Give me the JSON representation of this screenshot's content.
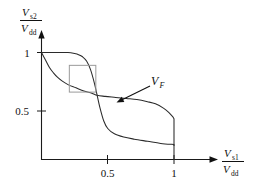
{
  "figure": {
    "kind": "butterfly-curve",
    "background_color": "#ffffff",
    "curve_color": "#2b2b2b",
    "axis_color": "#1a1a1a",
    "inset_box_color": "#9a9a9a"
  },
  "axes": {
    "y": {
      "numerator": "V",
      "numerator_sub": "s2",
      "denominator": "V",
      "denominator_sub": "dd",
      "ticks": [
        {
          "label": "1",
          "value": 1
        },
        {
          "label": "0.5",
          "value": 0.5
        }
      ]
    },
    "x": {
      "numerator": "V",
      "numerator_sub": "s1",
      "denominator": "V",
      "denominator_sub": "dd",
      "ticks": [
        {
          "label": "0.5",
          "value": 0.5
        },
        {
          "label": "1",
          "value": 1
        }
      ]
    }
  },
  "annotations": {
    "crossing_point": {
      "label_main": "V",
      "label_sub": "F",
      "x": 0.42,
      "y": 0.6
    }
  },
  "chart_data": {
    "type": "line",
    "title": "",
    "xlabel": "V_s1 / V_dd",
    "ylabel": "V_s2 / V_dd",
    "xlim": [
      0,
      1.12
    ],
    "ylim": [
      0,
      1.12
    ],
    "grid": false,
    "legend": "none",
    "xticks": [
      0.5,
      1
    ],
    "yticks": [
      0.5,
      1
    ],
    "annotations": [
      {
        "text": "V_F",
        "x": 0.42,
        "y": 0.6,
        "kind": "arrow-label"
      }
    ],
    "inset_box": {
      "x0": 0.21,
      "y0": 0.63,
      "x1": 0.41,
      "y1": 0.88
    },
    "series": [
      {
        "name": "inverter-1-vtc",
        "comment": "upper/flat branch: starts at (0,1), stays near 1, falls steeply near x=0.42, tails low, drops vertically at x=1",
        "x": [
          0.0,
          0.05,
          0.1,
          0.15,
          0.2,
          0.25,
          0.28,
          0.31,
          0.34,
          0.37,
          0.4,
          0.42,
          0.44,
          0.47,
          0.5,
          0.55,
          0.62,
          0.7,
          0.8,
          0.9,
          1.0,
          1.0
        ],
        "y": [
          1.0,
          1.0,
          1.0,
          1.0,
          1.0,
          0.99,
          0.98,
          0.96,
          0.92,
          0.84,
          0.71,
          0.6,
          0.49,
          0.36,
          0.29,
          0.24,
          0.21,
          0.19,
          0.17,
          0.15,
          0.14,
          0.0
        ]
      },
      {
        "name": "inverter-2-vtc-mirrored",
        "comment": "lower/steep-first branch: starts at (0,1), falls fast, long flat-ish middle through crossing, then decays and drops vertically at x=1",
        "x": [
          0.0,
          0.03,
          0.06,
          0.09,
          0.12,
          0.16,
          0.2,
          0.26,
          0.32,
          0.38,
          0.42,
          0.48,
          0.56,
          0.64,
          0.72,
          0.8,
          0.86,
          0.92,
          0.96,
          0.99,
          1.0,
          1.0
        ],
        "y": [
          1.0,
          0.93,
          0.86,
          0.81,
          0.77,
          0.73,
          0.7,
          0.67,
          0.64,
          0.62,
          0.6,
          0.59,
          0.58,
          0.57,
          0.56,
          0.54,
          0.52,
          0.48,
          0.44,
          0.4,
          0.38,
          0.13
        ]
      }
    ]
  }
}
